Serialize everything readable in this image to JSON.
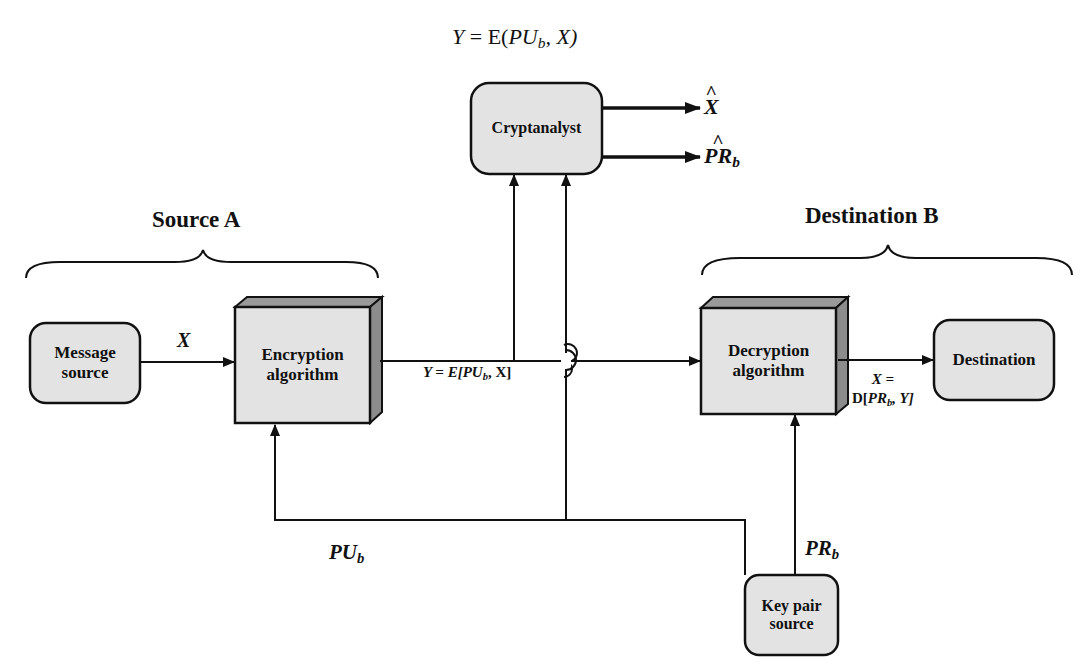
{
  "header": {
    "formula": "Y = E(PU_b, X)",
    "formula_parts": {
      "lhs": "Y",
      "eq": " = E(",
      "var": "PU",
      "sub": "b",
      "rest": ", X)"
    }
  },
  "groups": {
    "source": {
      "label": "Source A"
    },
    "destination": {
      "label": "Destination B"
    }
  },
  "nodes": {
    "message_source": {
      "line1": "Message",
      "line2": "source"
    },
    "encryption": {
      "line1": "Encryption",
      "line2": "algorithm"
    },
    "cryptanalyst": {
      "label": "Cryptanalyst"
    },
    "decryption": {
      "line1": "Decryption",
      "line2": "algorithm"
    },
    "destination": {
      "label": "Destination"
    },
    "key_pair_source": {
      "line1": "Key pair",
      "line2": "source"
    }
  },
  "edges": {
    "plaintext": {
      "label": "X"
    },
    "ciphertext": {
      "pre": "Y = E[",
      "var": "PU",
      "sub": "b",
      "post": ", X]"
    },
    "decrypted": {
      "line1": "X =",
      "pre": "D[",
      "var": "PR",
      "sub": "b",
      "post": ", Y]"
    },
    "public_key": {
      "var": "PU",
      "sub": "b"
    },
    "private_key": {
      "var": "PR",
      "sub": "b"
    },
    "estimate_x": {
      "var": "X"
    },
    "estimate_prb": {
      "var": "PR",
      "sub": "b"
    }
  },
  "colors": {
    "box_fill": "#e3e3e3",
    "box_side": "#8c8c8c",
    "box_top": "#9a9a9a",
    "stroke": "#111111"
  }
}
